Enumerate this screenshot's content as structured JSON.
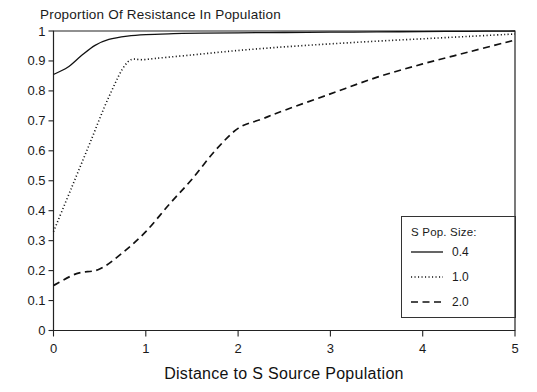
{
  "chart_data": {
    "type": "line",
    "title": "Proportion Of Resistance In Population",
    "xlabel": "Distance to S Source Population",
    "ylabel": "",
    "xlim": [
      0,
      5
    ],
    "ylim": [
      0,
      1
    ],
    "xticks": [
      "0",
      "1",
      "2",
      "3",
      "4",
      "5"
    ],
    "yticks": [
      "0",
      "0.1",
      "0.2",
      "0.3",
      "0.4",
      "0.5",
      "0.6",
      "0.7",
      "0.8",
      "0.9",
      "1"
    ],
    "grid": false,
    "legend_position": "right-outside",
    "legend_title": "S Pop. Size:",
    "series": [
      {
        "name": "0.4",
        "style": "solid",
        "x": [
          0,
          0.15,
          0.3,
          0.45,
          0.6,
          0.8,
          1.0,
          1.3,
          1.6,
          2.0,
          2.5,
          3.0,
          3.5,
          4.0,
          4.5,
          5.0
        ],
        "y": [
          0.855,
          0.878,
          0.917,
          0.952,
          0.972,
          0.983,
          0.988,
          0.991,
          0.993,
          0.994,
          0.995,
          0.996,
          0.997,
          0.998,
          0.999,
          1.0
        ]
      },
      {
        "name": "1.0",
        "style": "dotted",
        "x": [
          0,
          0.2,
          0.4,
          0.6,
          0.8,
          1.0,
          1.5,
          2.0,
          2.5,
          3.0,
          3.5,
          4.0,
          4.5,
          5.0
        ],
        "y": [
          0.33,
          0.48,
          0.63,
          0.78,
          0.895,
          0.905,
          0.92,
          0.935,
          0.947,
          0.957,
          0.966,
          0.974,
          0.982,
          0.99
        ]
      },
      {
        "name": "2.0",
        "style": "dashed",
        "x": [
          0,
          0.25,
          0.5,
          0.75,
          1.0,
          1.25,
          1.5,
          1.75,
          2.0,
          2.25,
          2.5,
          3.0,
          3.5,
          4.0,
          4.5,
          5.0
        ],
        "y": [
          0.15,
          0.19,
          0.205,
          0.26,
          0.33,
          0.42,
          0.505,
          0.6,
          0.675,
          0.705,
          0.735,
          0.79,
          0.845,
          0.89,
          0.93,
          0.97
        ]
      }
    ]
  },
  "colors": {
    "ink": "#111111",
    "background": "#ffffff"
  }
}
